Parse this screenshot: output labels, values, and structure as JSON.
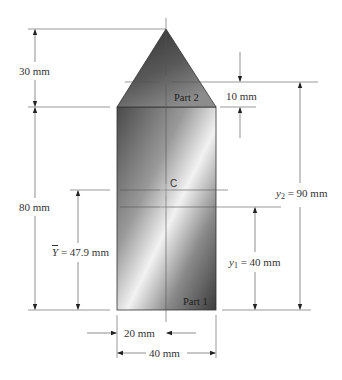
{
  "figure": {
    "type": "composite-area-centroid",
    "parts": [
      {
        "name": "Part 1",
        "shape": "rectangle",
        "width_mm": 40,
        "height_mm": 80,
        "centroid_y_mm": 40
      },
      {
        "name": "Part 2",
        "shape": "triangle",
        "base_mm": 40,
        "height_mm": 30,
        "centroid_y_mm": 90
      }
    ],
    "centroid_label": "C",
    "centroid_y_mm": 47.9
  },
  "labels": {
    "part1": "Part 1",
    "part2": "Part 2",
    "centroid": "C",
    "dim_30": "30 mm",
    "dim_80": "80 mm",
    "dim_10": "10 mm",
    "ybar_symbol": "Y",
    "ybar_value": " = 47.9 mm",
    "y1_symbol": "y",
    "y1_sub": "1",
    "y1_value": " = 40 mm",
    "y2_symbol": "y",
    "y2_sub": "2",
    "y2_value": " = 90 mm",
    "dim_20": "20 mm",
    "dim_40": "40 mm"
  },
  "colors": {
    "line": "#444444",
    "dark": "#3a3a3a",
    "light": "#f4f4f4"
  }
}
